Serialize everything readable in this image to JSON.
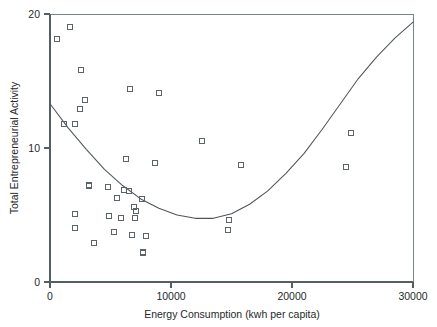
{
  "chart_data": {
    "type": "scatter",
    "title": "",
    "xlabel": "Energy Consumption (kwh per capita)",
    "ylabel": "Total Entrepreneurial Activity",
    "xlim": [
      0,
      30000
    ],
    "ylim": [
      0,
      20
    ],
    "xticks": [
      0,
      10000,
      20000,
      30000
    ],
    "yticks": [
      0,
      10,
      20
    ],
    "xtick_labels": [
      "0",
      "10000",
      "20000",
      "30000"
    ],
    "ytick_labels": [
      "0",
      "10",
      "20"
    ],
    "grid": false,
    "legend": null,
    "marker_style": "open-square",
    "points": [
      [
        580,
        18.1
      ],
      [
        1650,
        19.0
      ],
      [
        2560,
        15.8
      ],
      [
        2900,
        13.6
      ],
      [
        2450,
        12.9
      ],
      [
        6650,
        14.4
      ],
      [
        9000,
        14.1
      ],
      [
        1150,
        11.8
      ],
      [
        2100,
        11.8
      ],
      [
        24900,
        11.1
      ],
      [
        12550,
        10.5
      ],
      [
        6250,
        9.2
      ],
      [
        8650,
        8.9
      ],
      [
        15800,
        8.7
      ],
      [
        24500,
        8.6
      ],
      [
        3250,
        7.2
      ],
      [
        4800,
        7.1
      ],
      [
        6100,
        6.9
      ],
      [
        6500,
        6.8
      ],
      [
        5500,
        6.3
      ],
      [
        7600,
        6.2
      ],
      [
        6950,
        5.6
      ],
      [
        7100,
        5.3
      ],
      [
        2050,
        5.1
      ],
      [
        4900,
        4.9
      ],
      [
        5900,
        4.8
      ],
      [
        7000,
        4.8
      ],
      [
        14800,
        4.6
      ],
      [
        2100,
        4.0
      ],
      [
        5300,
        3.7
      ],
      [
        6800,
        3.5
      ],
      [
        7900,
        3.4
      ],
      [
        14700,
        3.9
      ],
      [
        3600,
        2.9
      ],
      [
        7700,
        2.2
      ]
    ],
    "fit_curve": {
      "type": "quadratic-trendline",
      "description": "U-shaped quadratic fit",
      "points": [
        [
          0,
          13.3
        ],
        [
          1500,
          11.5
        ],
        [
          3000,
          9.9
        ],
        [
          4500,
          8.4
        ],
        [
          6000,
          7.2
        ],
        [
          7500,
          6.2
        ],
        [
          9000,
          5.5
        ],
        [
          10500,
          5.0
        ],
        [
          12000,
          4.75
        ],
        [
          13500,
          4.75
        ],
        [
          15000,
          5.1
        ],
        [
          16500,
          5.8
        ],
        [
          18000,
          6.8
        ],
        [
          19500,
          8.1
        ],
        [
          21000,
          9.6
        ],
        [
          22500,
          11.4
        ],
        [
          24000,
          13.3
        ],
        [
          25500,
          15.2
        ],
        [
          27000,
          16.8
        ],
        [
          28500,
          18.2
        ],
        [
          30000,
          19.4
        ]
      ]
    }
  }
}
